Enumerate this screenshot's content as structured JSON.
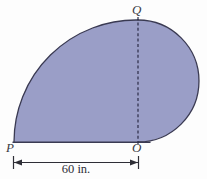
{
  "figure": {
    "background_color": "#fdfdfd",
    "fill_color": "#9a9ec7",
    "outline_color": "#3a3a52",
    "dimension_color": "#2e2e36"
  },
  "labels": {
    "top_vertex": "Q",
    "bottom_left_vertex": "P",
    "bottom_right_vertex": "O"
  },
  "dimension": {
    "value": "60 in.",
    "number": 60,
    "unit": "in."
  },
  "geometry": {
    "point_P": {
      "x": 14,
      "y": 142
    },
    "point_O": {
      "x": 138,
      "y": 142
    },
    "point_Q": {
      "x": 138,
      "y": 20
    },
    "quarter_arc_radius": 122,
    "semicircle_radius": 61,
    "semicircle_center": {
      "x": 138,
      "y": 81
    },
    "rightmost_extent_x": 199,
    "dashed_segment": "QO",
    "base_segment": "PO"
  }
}
